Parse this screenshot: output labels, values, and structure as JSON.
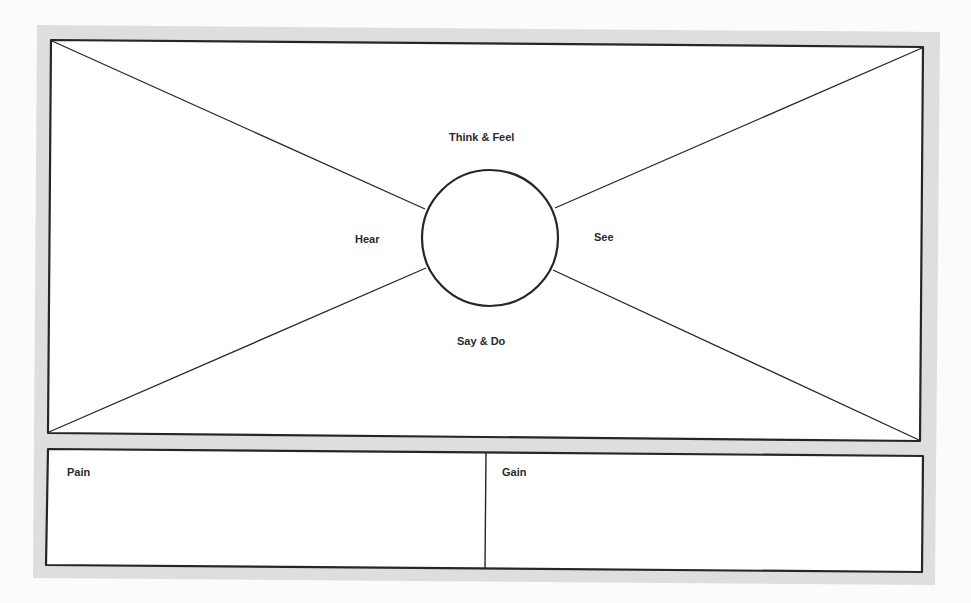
{
  "diagram": {
    "type": "empathy-map",
    "colors": {
      "page_background": "#fbfbfa",
      "frame_mat": "#dedede",
      "box_fill": "#ffffff",
      "stroke": "#262626",
      "text": "#2a2a2a"
    },
    "center_circle": {
      "cx": 490,
      "cy": 238,
      "r": 68
    },
    "quadrants": {
      "top": "Think & Feel",
      "left": "Hear",
      "right": "See",
      "bottom": "Say & Do"
    },
    "bottom_panels": [
      {
        "id": "pain",
        "label": "Pain"
      },
      {
        "id": "gain",
        "label": "Gain"
      }
    ]
  }
}
